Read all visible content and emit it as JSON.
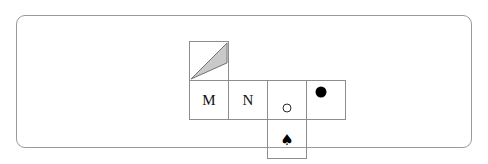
{
  "canvas": {
    "width": 488,
    "height": 164,
    "background_color": "#ffffff"
  },
  "frame": {
    "name": "rounded-panel-border",
    "border_color": "#9a9a9a",
    "corner_radius": "9px"
  },
  "figure": {
    "grid_line_color": "#8d8d8d",
    "cell_size_px": 40,
    "rows": [
      {
        "row_index": 0,
        "cells": [
          {
            "column": 0,
            "content_type": "triangle",
            "icon_name": "gray-triangle-icon",
            "fill_color": "#c9c9c9",
            "stroke_color": "#6e6e6e",
            "label": ""
          }
        ]
      },
      {
        "row_index": 1,
        "cells": [
          {
            "column": 0,
            "content_type": "letter",
            "label": "M",
            "color": "#111111"
          },
          {
            "column": 1,
            "content_type": "letter",
            "label": "N",
            "color": "#111111"
          },
          {
            "column": 2,
            "content_type": "open-circle",
            "icon_name": "open-circle-icon",
            "fill_color": "transparent",
            "stroke_color": "#2b2b2b",
            "label": ""
          },
          {
            "column": 3,
            "content_type": "filled-circle",
            "icon_name": "filled-circle-icon",
            "fill_color": "#000000",
            "label": ""
          }
        ]
      },
      {
        "row_index": 2,
        "cells": [
          {
            "column": 2,
            "content_type": "spade",
            "icon_name": "spade-suit-icon",
            "glyph": "♠",
            "fill_color": "#000000",
            "label": ""
          }
        ]
      }
    ]
  },
  "glyphs": {
    "spade": "♠",
    "letter_m": "M",
    "letter_n": "N"
  }
}
